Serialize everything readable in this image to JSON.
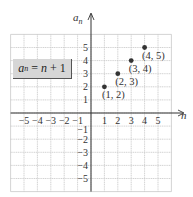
{
  "chart_data": {
    "type": "scatter",
    "title": "",
    "xlabel": "n",
    "ylabel": "a_n",
    "xlim": [
      -6,
      6
    ],
    "ylim": [
      -6,
      6
    ],
    "grid": true,
    "x_ticks": [
      -5,
      -4,
      -3,
      -2,
      -1,
      1,
      2,
      3,
      4,
      5
    ],
    "y_ticks": [
      -5,
      -4,
      -3,
      -2,
      -1,
      1,
      2,
      3,
      4,
      5
    ],
    "x_tick_labels": [
      "−5",
      "−4",
      "−3",
      "−2",
      "−1",
      "1",
      "2",
      "3",
      "4",
      "5"
    ],
    "y_tick_labels": [
      "−5",
      "−4",
      "−3",
      "−2",
      "−1",
      "1",
      "2",
      "3",
      "4",
      "5"
    ],
    "series": [
      {
        "name": "a_n = n + 1",
        "points": [
          {
            "x": 1,
            "y": 2,
            "label": "(1, 2)"
          },
          {
            "x": 2,
            "y": 3,
            "label": "(2, 3)"
          },
          {
            "x": 3,
            "y": 4,
            "label": "(3, 4)"
          },
          {
            "x": 4,
            "y": 5,
            "label": "(4, 5)"
          }
        ]
      }
    ],
    "annotations": [
      {
        "text": "a_n = n + 1",
        "position": "upper-left box"
      }
    ]
  },
  "equation": {
    "var": "a",
    "sub": "n",
    "rhs": " = n + 1",
    "rhs_var": "n",
    "rhs_rest": " + 1",
    "eq": " = "
  },
  "axes": {
    "x_label": "n",
    "y_label_main": "a",
    "y_label_sub": "n"
  },
  "colors": {
    "grid": "#c8c8c8",
    "axis": "#333333",
    "point": "#333333",
    "box_fill": "#d6d6d6"
  }
}
